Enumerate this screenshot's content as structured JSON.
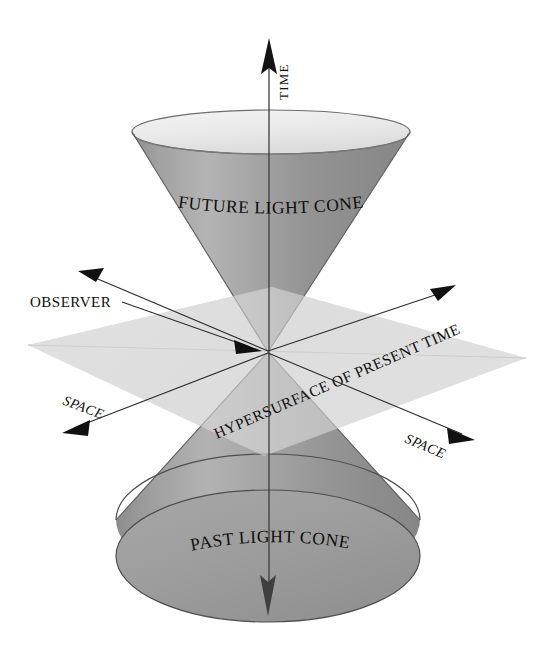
{
  "figure": {
    "background_color": "#ffffff",
    "ink_color": "#1a1a1a",
    "cone_surface_color": "#9b9b9b",
    "cone_interior_color": "#eeeeee",
    "plane_color": "#d8d8d8",
    "plane_shadow_color": "#c6c6c6"
  },
  "labels": {
    "future_cone": "FUTURE LIGHT CONE",
    "past_cone": "PAST LIGHT CONE",
    "observer": "OBSERVER",
    "hypersurface": "HYPERSURFACE OF PRESENT TIME",
    "time_axis": "TIME",
    "space_axis_left": "SPACE",
    "space_axis_right": "SPACE"
  },
  "letters": {
    "future": [
      "F",
      "U",
      "T",
      "U",
      "R",
      "E",
      " ",
      "L",
      "I",
      "G",
      "H",
      "T",
      " ",
      "C",
      "O",
      "N",
      "E"
    ],
    "past": [
      "P",
      "A",
      "S",
      "T",
      " ",
      "L",
      "I",
      "G",
      "H",
      "T",
      " ",
      "C",
      "O",
      "N",
      "E"
    ],
    "hypersurface": [
      "H",
      "Y",
      "P",
      "E",
      "R",
      "S",
      "U",
      "R",
      "F",
      "A",
      "C",
      "E",
      " ",
      "O",
      "F",
      " ",
      "P",
      "R",
      "E",
      "S",
      "E",
      "N",
      "T",
      " ",
      "T",
      "I",
      "M",
      "E"
    ]
  },
  "geometry": {
    "origin_x": 268,
    "origin_y": 352,
    "future_rim_center_x": 271,
    "future_rim_center_y": 132,
    "future_rim_rx": 139,
    "future_rim_ry": 22,
    "past_base_center_x": 268,
    "past_base_center_y": 556,
    "past_base_rx": 152,
    "past_base_ry": 66,
    "time_arrow_top_y": 40,
    "time_arrow_bottom_y": 614
  },
  "arrows": [
    {
      "name": "time-up",
      "label": "TIME",
      "direction": "up"
    },
    {
      "name": "time-down",
      "label": "",
      "direction": "down"
    },
    {
      "name": "space-upper-left",
      "label": "",
      "direction": "up-left"
    },
    {
      "name": "space-upper-right",
      "label": "",
      "direction": "up-right"
    },
    {
      "name": "space-lower-left",
      "label": "SPACE",
      "direction": "down-left"
    },
    {
      "name": "space-lower-right",
      "label": "SPACE",
      "direction": "down-right"
    },
    {
      "name": "observer-pointer",
      "label": "OBSERVER",
      "direction": "to-origin"
    }
  ]
}
